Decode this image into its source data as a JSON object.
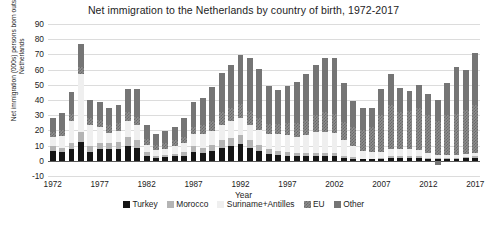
{
  "chart_data": {
    "type": "bar",
    "stacked": true,
    "title": "Net immigration to the Netherlands by country of birth, 1972-2017",
    "xlabel": "Year",
    "ylabel": "Net immigration (000s) persons born outside Netherlands",
    "ylim": [
      -10,
      90
    ],
    "ytick_step": 10,
    "yticks": [
      90,
      80,
      70,
      60,
      50,
      40,
      30,
      20,
      10,
      0,
      -10
    ],
    "grid": true,
    "legend_position": "bottom",
    "x": [
      1972,
      1973,
      1974,
      1975,
      1976,
      1977,
      1978,
      1979,
      1980,
      1981,
      1982,
      1983,
      1984,
      1985,
      1986,
      1987,
      1988,
      1989,
      1990,
      1991,
      1992,
      1993,
      1994,
      1995,
      1996,
      1997,
      1998,
      1999,
      2000,
      2001,
      2002,
      2003,
      2004,
      2005,
      2006,
      2007,
      2008,
      2009,
      2010,
      2011,
      2012,
      2013,
      2014,
      2015,
      2016,
      2017
    ],
    "xticks": [
      1972,
      1977,
      1982,
      1987,
      1992,
      1997,
      2002,
      2007,
      2012,
      2017
    ],
    "series": [
      {
        "name": "Turkey",
        "color": "#151515",
        "values": [
          6.5,
          6.0,
          8.0,
          12.5,
          6.0,
          8.0,
          7.5,
          8.0,
          10.0,
          8.5,
          3.5,
          2.0,
          2.5,
          3.0,
          3.5,
          6.0,
          5.0,
          6.5,
          8.5,
          9.5,
          11.0,
          8.5,
          6.5,
          4.5,
          4.0,
          3.5,
          3.0,
          3.0,
          3.0,
          3.0,
          3.0,
          2.0,
          1.5,
          1.0,
          1.0,
          1.5,
          2.0,
          2.0,
          2.0,
          2.0,
          1.5,
          1.5,
          1.5,
          1.5,
          2.0,
          2.0
        ]
      },
      {
        "name": "Morocco",
        "color": "#b4b4b4",
        "values": [
          3.0,
          2.5,
          3.5,
          6.5,
          3.5,
          4.0,
          4.0,
          4.5,
          6.0,
          5.0,
          2.0,
          1.0,
          1.5,
          1.5,
          2.0,
          3.5,
          3.5,
          4.0,
          5.0,
          5.5,
          6.0,
          5.0,
          4.0,
          3.0,
          2.5,
          2.5,
          2.0,
          2.0,
          2.0,
          2.0,
          2.0,
          1.5,
          1.0,
          0.5,
          0.5,
          0.5,
          1.0,
          1.0,
          1.0,
          1.0,
          0.5,
          0.5,
          0.5,
          0.5,
          0.5,
          1.0
        ]
      },
      {
        "name": "Suriname+Antilles",
        "color": "#efefef",
        "values": [
          6.0,
          8.0,
          15.0,
          38.0,
          14.0,
          10.0,
          7.0,
          7.0,
          10.0,
          10.0,
          5.0,
          4.0,
          4.0,
          5.0,
          6.0,
          8.0,
          9.0,
          9.0,
          10.0,
          11.0,
          11.0,
          10.0,
          10.0,
          10.0,
          11.0,
          11.0,
          11.0,
          12.0,
          14.0,
          14.0,
          13.0,
          10.0,
          7.0,
          5.0,
          4.0,
          4.0,
          5.0,
          5.0,
          5.0,
          4.0,
          3.0,
          2.0,
          2.0,
          2.0,
          2.0,
          2.0
        ]
      },
      {
        "name": "EU",
        "color": "#8e8e8e",
        "values": [
          3.5,
          4.0,
          4.5,
          5.0,
          4.5,
          5.0,
          5.0,
          5.5,
          6.0,
          5.5,
          4.0,
          3.5,
          3.5,
          4.0,
          4.5,
          5.0,
          6.0,
          7.0,
          8.5,
          9.0,
          9.5,
          9.0,
          8.0,
          7.0,
          7.0,
          8.0,
          9.0,
          10.0,
          11.0,
          13.0,
          13.0,
          12.0,
          13.0,
          14.0,
          17.0,
          24.0,
          29.0,
          24.0,
          25.0,
          28.0,
          25.0,
          22.0,
          26.0,
          27.0,
          29.0,
          32.0
        ]
      },
      {
        "name": "Other",
        "color": "#757575",
        "values": [
          9.0,
          11.0,
          14.0,
          15.0,
          12.0,
          12.0,
          11.0,
          12.0,
          15.0,
          18.0,
          9.0,
          7.0,
          8.0,
          9.0,
          12.0,
          16.0,
          18.0,
          22.0,
          26.0,
          28.0,
          32.0,
          35.0,
          32.0,
          25.0,
          22.0,
          24.0,
          27.0,
          30.0,
          33.0,
          36.0,
          37.0,
          26.0,
          17.0,
          14.0,
          12.0,
          17.0,
          20.0,
          16.0,
          13.0,
          15.0,
          14.0,
          14.0,
          21.0,
          31.0,
          26.0,
          34.0
        ]
      }
    ],
    "negative_values": {
      "2013": -3.0
    }
  },
  "legend": {
    "items": [
      {
        "label": "Turkey"
      },
      {
        "label": "Morocco"
      },
      {
        "label": "Suriname+Antilles"
      },
      {
        "label": "EU"
      },
      {
        "label": "Other"
      }
    ]
  }
}
